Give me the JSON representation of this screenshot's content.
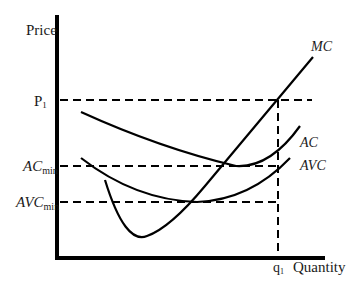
{
  "diagram": {
    "type": "cost-curves",
    "axes": {
      "y_label": "Price",
      "x_label": "Quantity"
    },
    "price_levels": {
      "p1": {
        "base": "P",
        "sub": "1"
      },
      "ac_min": {
        "base": "AC",
        "sub": "min"
      },
      "avc_min": {
        "base": "AVC",
        "sub": "min"
      }
    },
    "quantity_levels": {
      "q1": {
        "base": "q",
        "sub": "1"
      }
    },
    "curves": {
      "mc": {
        "label": "MC"
      },
      "ac": {
        "label": "AC"
      },
      "avc": {
        "label": "AVC"
      }
    },
    "colors": {
      "line": "#000000",
      "text": "#1a1a1a",
      "background": "#ffffff"
    }
  }
}
